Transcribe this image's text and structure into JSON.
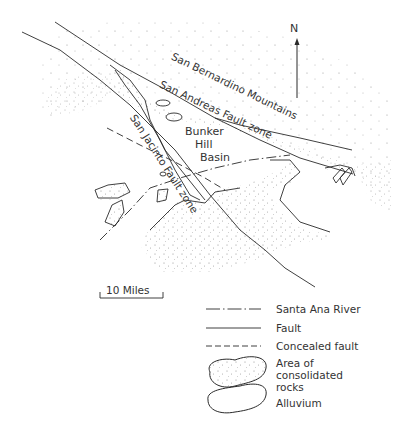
{
  "map": {
    "labels": {
      "mountains": "San Bernardino Mountains",
      "san_andreas": "San Andreas Fault zone",
      "san_jacinto": "San Jacinto Fault zone",
      "basin_line1": "Bunker",
      "basin_line2": "Hill",
      "basin_line3": "Basin"
    },
    "north_arrow": {
      "label": "N",
      "icon": "north-arrow-icon"
    },
    "scale_bar": {
      "label": "10 Miles"
    }
  },
  "legend": {
    "items": [
      {
        "symbol": "dash-dot-line",
        "label": "Santa Ana River"
      },
      {
        "symbol": "solid-line",
        "label": "Fault"
      },
      {
        "symbol": "dashed-line",
        "label": "Concealed fault"
      },
      {
        "symbol": "stippled-shape",
        "label_lines": [
          "Area of",
          "consolidated",
          "rocks"
        ]
      },
      {
        "symbol": "outline-shape",
        "label": "Alluvium"
      }
    ]
  },
  "colors": {
    "ink": "#2a2a2a",
    "background": "#ffffff",
    "stipple": "#8a8a8a"
  }
}
